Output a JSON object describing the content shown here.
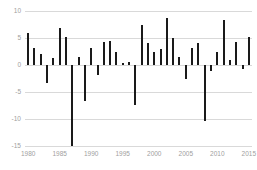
{
  "chart_data": {
    "type": "bar",
    "title": "",
    "subtitle": "",
    "xlabel": "",
    "ylabel": "",
    "xlim": [
      1979.5,
      2015.5
    ],
    "ylim": [
      -15,
      10
    ],
    "grid": true,
    "legend": null,
    "y_ticks": [
      10,
      5,
      0,
      -5,
      -10,
      -15
    ],
    "y_tick_labels": [
      "10",
      "5",
      "0",
      "-5",
      "-10",
      "-15"
    ],
    "x_ticks": [
      1980,
      1985,
      1990,
      1995,
      2000,
      2005,
      2010,
      2015
    ],
    "x_tick_labels": [
      "1980",
      "1985",
      "1990",
      "1995",
      "2000",
      "2005",
      "2010",
      "2015"
    ],
    "bar_color": "#1a1a1a",
    "grid_color": "#d9d9d9",
    "tick_label_color": "#a0a0a0",
    "categories": [
      1980,
      1981,
      1982,
      1983,
      1984,
      1985,
      1986,
      1987,
      1988,
      1989,
      1990,
      1991,
      1992,
      1993,
      1994,
      1995,
      1996,
      1997,
      1998,
      1999,
      2000,
      2001,
      2002,
      2003,
      2004,
      2005,
      2006,
      2007,
      2008,
      2009,
      2010,
      2011,
      2012,
      2013,
      2014,
      2015
    ],
    "values": [
      5.9,
      3.2,
      2.0,
      -3.3,
      1.3,
      6.8,
      5.1,
      -15.0,
      1.5,
      -6.6,
      3.1,
      -1.8,
      4.2,
      4.5,
      2.4,
      0.4,
      0.5,
      -7.4,
      7.5,
      4.0,
      2.4,
      3.0,
      8.7,
      5.0,
      1.4,
      -2.6,
      3.1,
      4.0,
      -10.4,
      -1.1,
      2.5,
      8.3,
      1.0,
      4.3,
      -0.7,
      5.1
    ]
  }
}
